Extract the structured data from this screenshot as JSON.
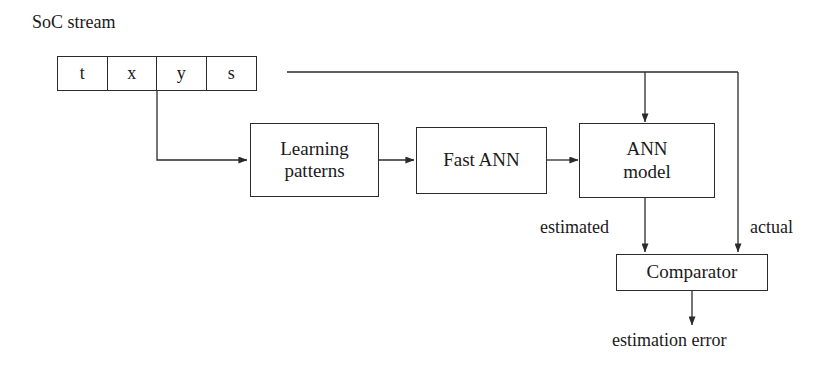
{
  "diagram": {
    "title_label": "SoC stream",
    "stream_table": {
      "name": "soc-stream-record",
      "cells": [
        {
          "label": "t"
        },
        {
          "label": "x"
        },
        {
          "label": "y"
        },
        {
          "label": "s"
        }
      ]
    },
    "nodes": [
      {
        "id": "learning-patterns",
        "line1": "Learning",
        "line2": "patterns"
      },
      {
        "id": "fast-ann",
        "line1": "Fast ANN",
        "line2": ""
      },
      {
        "id": "ann-model",
        "line1": "ANN",
        "line2": "model"
      },
      {
        "id": "comparator",
        "line1": "Comparator",
        "line2": ""
      }
    ],
    "edge_labels": {
      "estimated": "estimated",
      "actual": "actual",
      "output": "estimation error"
    },
    "colors": {
      "stroke": "#2b2b2b",
      "text": "#1a1a1a",
      "background": "#ffffff"
    }
  }
}
